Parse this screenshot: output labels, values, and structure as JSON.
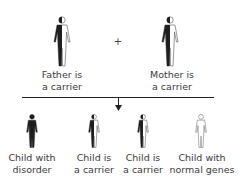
{
  "parents": {
    "operator": "+",
    "father": {
      "label_line1": "Father is",
      "label_line2": "a carrier",
      "status": "carrier"
    },
    "mother": {
      "label_line1": "Mother is",
      "label_line2": "a carrier",
      "status": "carrier"
    }
  },
  "children": [
    {
      "label_line1": "Child with",
      "label_line2": "disorder",
      "status": "affected"
    },
    {
      "label_line1": "Child is",
      "label_line2": "a carrier",
      "status": "carrier"
    },
    {
      "label_line1": "Child is",
      "label_line2": "a carrier",
      "status": "carrier"
    },
    {
      "label_line1": "Child with",
      "label_line2": "normal genes",
      "status": "normal"
    }
  ],
  "colors": {
    "filled": "#1e1e1e",
    "outline": "#555555",
    "empty": "#ffffff",
    "line": "#222222"
  }
}
